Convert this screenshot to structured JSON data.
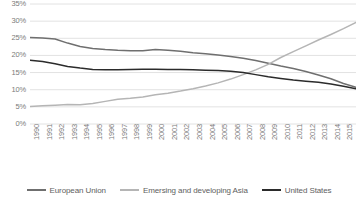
{
  "chart_data": {
    "type": "line",
    "title": "",
    "subtitle": "",
    "xlabel": "",
    "ylabel": "",
    "grid": true,
    "legend_position": "bottom",
    "ylim": [
      0,
      35
    ],
    "y_ticks": [
      "0%",
      "5%",
      "10%",
      "15%",
      "20%",
      "25%",
      "30%",
      "35%"
    ],
    "y_tick_values": [
      0,
      5,
      10,
      15,
      20,
      25,
      30,
      35
    ],
    "categories": [
      "1990",
      "1991",
      "1992",
      "1993",
      "1994",
      "1995",
      "1996",
      "1997",
      "1998",
      "1999",
      "2000",
      "2001",
      "2002",
      "2003",
      "2004",
      "2005",
      "2006",
      "2007",
      "2008",
      "2009",
      "2010",
      "2011",
      "2012",
      "2013",
      "2014",
      "2015",
      "2016"
    ],
    "series": [
      {
        "name": "European Union",
        "color": "#6f6f6f",
        "values": [
          25.2,
          25.1,
          24.8,
          23.6,
          22.6,
          22.0,
          21.7,
          21.5,
          21.4,
          21.4,
          21.7,
          21.5,
          21.2,
          20.8,
          20.5,
          20.1,
          19.7,
          19.2,
          18.5,
          17.7,
          16.9,
          16.2,
          15.3,
          14.3,
          13.2,
          11.8,
          10.7
        ]
      },
      {
        "name": "Emersing and developing Asia",
        "color": "#b5b5b5",
        "values": [
          5.1,
          5.3,
          5.5,
          5.7,
          5.6,
          6.0,
          6.6,
          7.2,
          7.5,
          7.9,
          8.5,
          9.0,
          9.6,
          10.3,
          11.1,
          12.0,
          13.1,
          14.4,
          15.8,
          17.4,
          19.4,
          21.1,
          22.8,
          24.5,
          26.1,
          27.8,
          29.6
        ]
      },
      {
        "name": "United States",
        "color": "#2b2b2b",
        "values": [
          18.6,
          18.2,
          17.6,
          16.8,
          16.3,
          15.9,
          15.8,
          15.8,
          15.9,
          16.0,
          16.0,
          15.9,
          15.9,
          15.8,
          15.7,
          15.6,
          15.4,
          15.0,
          14.4,
          13.8,
          13.3,
          12.8,
          12.5,
          12.2,
          11.7,
          11.0,
          10.3
        ]
      }
    ],
    "annotations": []
  },
  "legend": {
    "items": [
      {
        "label": "European Union",
        "color": "#6f6f6f"
      },
      {
        "label": "Emersing and developing Asia",
        "color": "#b5b5b5"
      },
      {
        "label": "United States",
        "color": "#2b2b2b"
      }
    ]
  },
  "colors": {
    "grid": "#e2e2e2",
    "axis_text": "#7b7b7b",
    "legend_text": "#5e5e5e",
    "background": "#ffffff"
  }
}
